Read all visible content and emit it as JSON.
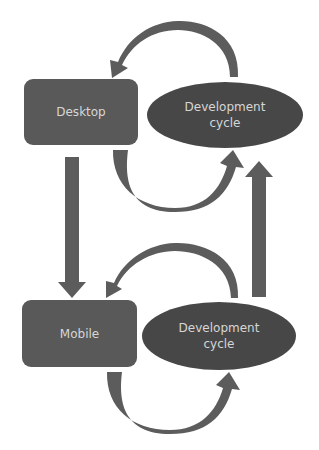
{
  "diagram": {
    "colors": {
      "box": "#595959",
      "ellipse": "#474747",
      "arrow": "#5c5c5c",
      "text": "#d6d6d6",
      "background": "#ffffff"
    },
    "nodes": {
      "desktop": {
        "label": "Desktop",
        "shape": "rounded-rect"
      },
      "desktop_cycle": {
        "label_line1": "Development",
        "label_line2": "cycle",
        "shape": "ellipse"
      },
      "mobile": {
        "label": "Mobile",
        "shape": "rounded-rect"
      },
      "mobile_cycle": {
        "label_line1": "Development",
        "label_line2": "cycle",
        "shape": "ellipse"
      }
    },
    "edges": [
      {
        "from": "desktop_cycle",
        "to": "desktop",
        "type": "curved-arrow-over"
      },
      {
        "from": "desktop",
        "to": "desktop_cycle",
        "type": "curved-arrow-under"
      },
      {
        "from": "desktop",
        "to": "mobile",
        "type": "straight-arrow-down"
      },
      {
        "from": "mobile",
        "to": "desktop_cycle",
        "type": "straight-arrow-up"
      },
      {
        "from": "mobile_cycle",
        "to": "mobile",
        "type": "curved-arrow-over"
      },
      {
        "from": "mobile",
        "to": "mobile_cycle",
        "type": "curved-arrow-under"
      }
    ]
  }
}
